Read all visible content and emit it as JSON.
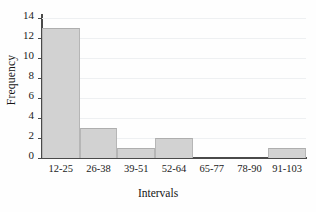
{
  "chart_data": {
    "type": "bar",
    "title": "",
    "subtitle": "",
    "xlabel": "Intervals",
    "ylabel": "Frequency",
    "categories": [
      "12-25",
      "26-38",
      "39-51",
      "52-64",
      "65-77",
      "78-90",
      "91-103"
    ],
    "values": [
      13,
      3,
      1,
      2,
      0,
      0,
      1
    ],
    "series": [
      {
        "name": "Frequency",
        "values": [
          13,
          3,
          1,
          2,
          0,
          0,
          1
        ]
      }
    ],
    "ylim": [
      0,
      14
    ],
    "xlim_categories": 7,
    "y_ticks": [
      0,
      2,
      4,
      6,
      8,
      10,
      12,
      14
    ],
    "y_tick_labels": [
      "0",
      "2",
      "4",
      "6",
      "8",
      "10",
      "12",
      "14"
    ],
    "grid": true,
    "grid_axis": "y",
    "legend": false,
    "legend_position": "none",
    "bar_gap": 0,
    "colors": {
      "bar_fill": "#d2d2d2",
      "bar_edge": "#b6b6b6",
      "axis": "#4a4a4a",
      "grid": "#eef0f2",
      "text": "#1a1a1a",
      "background": "#fefefe"
    }
  }
}
